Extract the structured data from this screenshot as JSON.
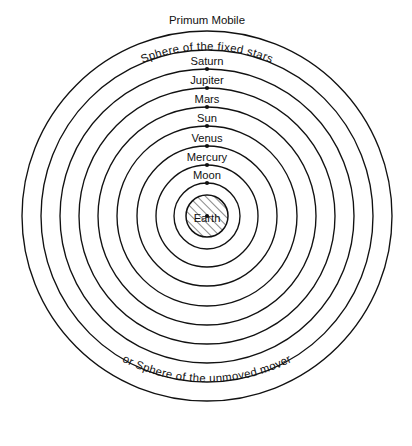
{
  "diagram": {
    "background_color": "#ffffff",
    "line_color": "#111111",
    "center": {
      "x": 207,
      "y": 216
    },
    "top_label": "Primum Mobile",
    "outer_sphere_label": "Sphere of the fixed stars",
    "bottom_caption": "or Sphere of the unmoved mover",
    "center_body": {
      "name": "Earth",
      "radius": 21,
      "fill": "hatched",
      "hatch_angle_deg": 45
    },
    "spheres": [
      {
        "label": "Primum Mobile",
        "radius": 185,
        "has_dot": false,
        "label_style": "straight-outside"
      },
      {
        "label": "Sphere of the fixed stars",
        "radius": 166,
        "has_dot": false,
        "label_style": "curved-on-arc"
      },
      {
        "label": "Saturn",
        "radius": 147,
        "has_dot": true,
        "label_style": "straight-above"
      },
      {
        "label": "Jupiter",
        "radius": 128,
        "has_dot": true,
        "label_style": "straight-above"
      },
      {
        "label": "Mars",
        "radius": 109,
        "has_dot": true,
        "label_style": "straight-above"
      },
      {
        "label": "Sun",
        "radius": 90,
        "has_dot": true,
        "label_style": "straight-above"
      },
      {
        "label": "Venus",
        "radius": 70,
        "has_dot": true,
        "label_style": "straight-above"
      },
      {
        "label": "Mercury",
        "radius": 51,
        "has_dot": true,
        "label_style": "straight-above"
      },
      {
        "label": "Moon",
        "radius": 33,
        "has_dot": true,
        "label_style": "straight-above"
      }
    ]
  }
}
